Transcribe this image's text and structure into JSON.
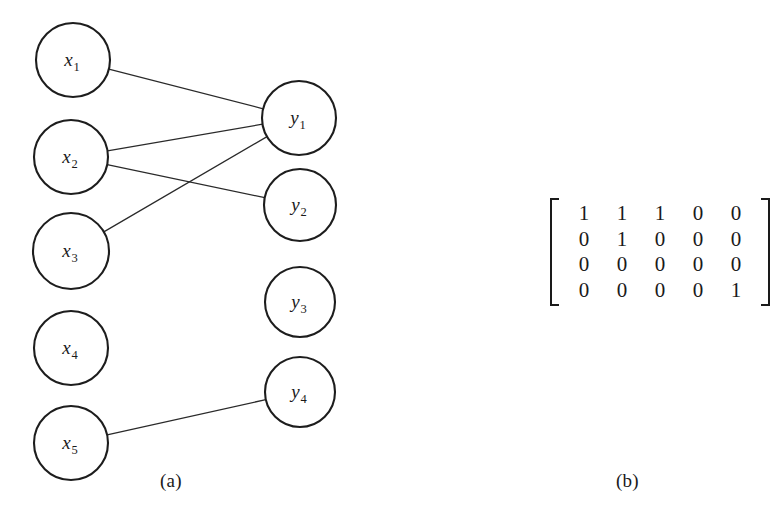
{
  "figure": {
    "background_color": "#ffffff",
    "stroke_color": "#1d1d1d",
    "edge_color": "#2a2a2a"
  },
  "panel_a": {
    "caption": "(a)",
    "left_nodes": [
      {
        "id": "x1",
        "base": "x",
        "sub": "1",
        "cx": 73,
        "cy": 60,
        "r": 37
      },
      {
        "id": "x2",
        "base": "x",
        "sub": "2",
        "cx": 71,
        "cy": 157,
        "r": 37
      },
      {
        "id": "x3",
        "base": "x",
        "sub": "3",
        "cx": 71,
        "cy": 251,
        "r": 38
      },
      {
        "id": "x4",
        "base": "x",
        "sub": "4",
        "cx": 71,
        "cy": 348,
        "r": 37
      },
      {
        "id": "x5",
        "base": "x",
        "sub": "5",
        "cx": 71,
        "cy": 443,
        "r": 37
      }
    ],
    "right_nodes": [
      {
        "id": "y1",
        "base": "y",
        "sub": "1",
        "cx": 299,
        "cy": 118,
        "r": 37
      },
      {
        "id": "y2",
        "base": "y",
        "sub": "2",
        "cx": 300,
        "cy": 205,
        "r": 36
      },
      {
        "id": "y3",
        "base": "y",
        "sub": "3",
        "cx": 300,
        "cy": 302,
        "r": 35
      },
      {
        "id": "y4",
        "base": "y",
        "sub": "4",
        "cx": 300,
        "cy": 392,
        "r": 35
      }
    ],
    "edges": [
      {
        "from": "x1",
        "to": "y1"
      },
      {
        "from": "x2",
        "to": "y1"
      },
      {
        "from": "x2",
        "to": "y2"
      },
      {
        "from": "x3",
        "to": "y1"
      },
      {
        "from": "x5",
        "to": "y4"
      }
    ]
  },
  "panel_b": {
    "caption": "(b)",
    "matrix": {
      "rows": 4,
      "cols": 5,
      "values": [
        [
          1,
          1,
          1,
          0,
          0
        ],
        [
          0,
          1,
          0,
          0,
          0
        ],
        [
          0,
          0,
          0,
          0,
          0
        ],
        [
          0,
          0,
          0,
          0,
          1
        ]
      ]
    }
  },
  "chart_data": {
    "type": "diagram",
    "title": "",
    "subfigures": [
      {
        "label": "(a)",
        "kind": "bipartite-graph",
        "left_vertices": [
          "x1",
          "x2",
          "x3",
          "x4",
          "x5"
        ],
        "right_vertices": [
          "y1",
          "y2",
          "y3",
          "y4"
        ],
        "edges": [
          [
            "x1",
            "y1"
          ],
          [
            "x2",
            "y1"
          ],
          [
            "x2",
            "y2"
          ],
          [
            "x3",
            "y1"
          ],
          [
            "x5",
            "y4"
          ]
        ]
      },
      {
        "label": "(b)",
        "kind": "biadjacency-matrix",
        "row_labels": [
          "y1",
          "y2",
          "y3",
          "y4"
        ],
        "col_labels": [
          "x1",
          "x2",
          "x3",
          "x4",
          "x5"
        ],
        "values": [
          [
            1,
            1,
            1,
            0,
            0
          ],
          [
            0,
            1,
            0,
            0,
            0
          ],
          [
            0,
            0,
            0,
            0,
            0
          ],
          [
            0,
            0,
            0,
            0,
            1
          ]
        ]
      }
    ]
  }
}
